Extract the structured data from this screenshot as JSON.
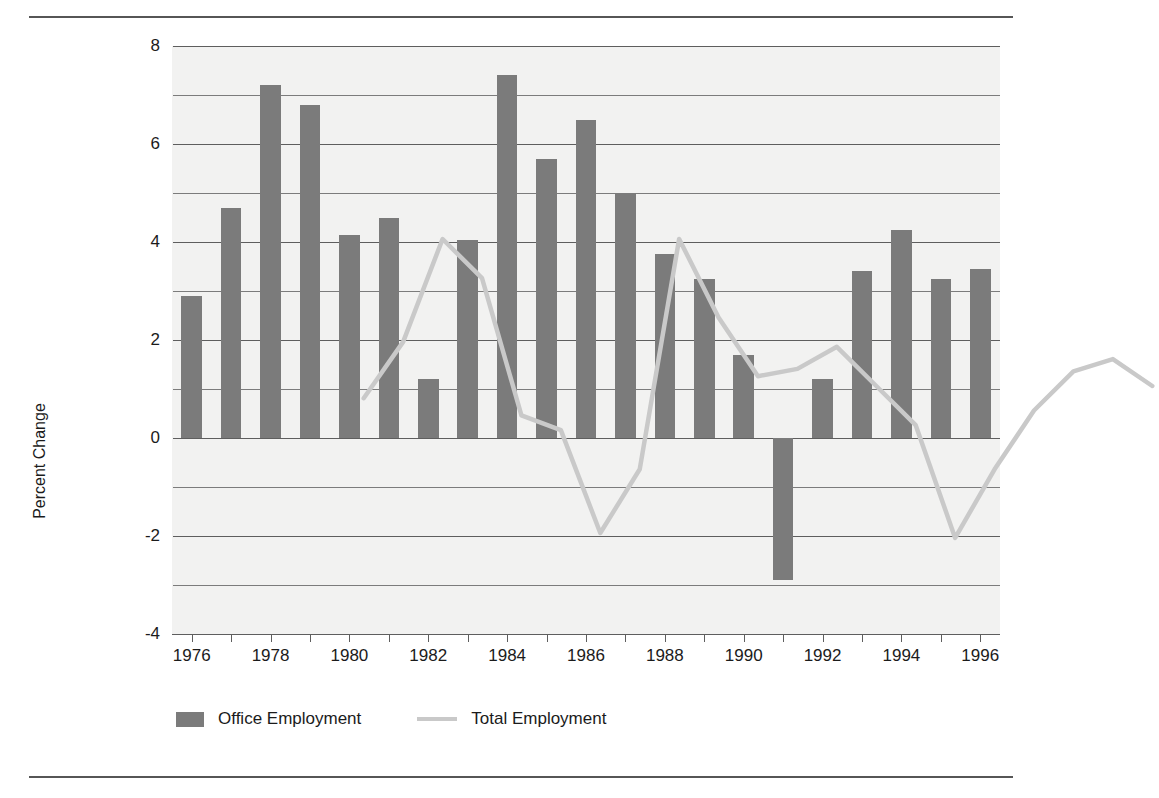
{
  "chart_data": {
    "type": "bar",
    "title": "",
    "subtitle": "",
    "xlabel": "",
    "ylabel": "Percent Change",
    "x": [
      1976,
      1977,
      1978,
      1979,
      1980,
      1981,
      1982,
      1983,
      1984,
      1985,
      1986,
      1987,
      1988,
      1989,
      1990,
      1991,
      1992,
      1993,
      1994,
      1995,
      1996
    ],
    "categories": [
      "1976",
      "1977",
      "1978",
      "1979",
      "1980",
      "1981",
      "1982",
      "1983",
      "1984",
      "1985",
      "1986",
      "1987",
      "1988",
      "1989",
      "1990",
      "1991",
      "1992",
      "1993",
      "1994",
      "1995",
      "1996"
    ],
    "xtick_labels": [
      "1976",
      "1978",
      "1980",
      "1982",
      "1984",
      "1986",
      "1988",
      "1990",
      "1992",
      "1994",
      "1996"
    ],
    "ytick_labels": [
      "8",
      "6",
      "4",
      "2",
      "0",
      "-2",
      "-4"
    ],
    "ylim": [
      -4,
      8
    ],
    "ytick_values": [
      8,
      6,
      4,
      2,
      0,
      -2,
      -4
    ],
    "gridline_values": [
      8,
      7,
      6,
      5,
      4,
      3,
      2,
      1,
      0,
      -1,
      -2,
      -3,
      -4
    ],
    "grid": true,
    "legend_position": "bottom-left",
    "series": [
      {
        "name": "Office Employment",
        "type": "bar",
        "color": "#7b7b7b",
        "values": [
          2.9,
          4.7,
          7.2,
          6.8,
          4.15,
          4.5,
          1.2,
          4.05,
          7.4,
          5.7,
          6.5,
          5.0,
          3.75,
          3.25,
          1.7,
          -2.9,
          1.2,
          3.4,
          4.25,
          3.25,
          3.45
        ]
      },
      {
        "name": "Total Employment",
        "type": "line",
        "color": "#c9c9c9",
        "values": [
          1.75,
          2.9,
          5.0,
          4.2,
          1.4,
          1.1,
          -1.0,
          0.3,
          5.0,
          3.4,
          2.2,
          2.35,
          2.8,
          2.0,
          1.2,
          -1.1,
          0.3,
          1.5,
          2.3,
          2.55,
          2.0
        ]
      }
    ]
  },
  "legend": {
    "entries": [
      {
        "label": "Office Employment",
        "marker": "bar-swatch"
      },
      {
        "label": "Total Employment",
        "marker": "line-swatch"
      }
    ]
  },
  "colors": {
    "bar": "#7b7b7b",
    "line": "#c9c9c9",
    "plot_background": "#f2f2f1",
    "gridline": "#5e5e5e",
    "rule": "#565656",
    "text": "#1b1b1b"
  }
}
